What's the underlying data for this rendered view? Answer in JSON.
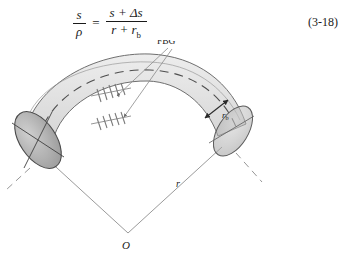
{
  "equation": {
    "name": "bend-strain-relation",
    "left": {
      "numerator": "s",
      "denominator": "ρ"
    },
    "relation": "=",
    "right": {
      "numerator": "s + Δs",
      "denominator_main": "r + r",
      "denominator_sub": "b"
    },
    "number": "(3-18)"
  },
  "figure": {
    "labels": {
      "fbg": "FBG",
      "radius": "r",
      "tube_radius_main": "r",
      "tube_radius_sub": "b",
      "center": "O"
    },
    "colors": {
      "tube_fill": "#e3e3e3",
      "tube_stroke": "#6f6f6f",
      "endcap_fill": "#b4b4b4",
      "endcap_stroke": "#4a4a4a",
      "leader_line": "#8a8a8a",
      "radius_line": "#8a8a8a",
      "dashed_center": "#555555",
      "grating": "#777777",
      "background": "#ffffff",
      "text": "#1a1a1a"
    },
    "grating_sets": [
      {
        "name": "fbg-grating-outer",
        "ticks": 5
      },
      {
        "name": "fbg-grating-inner",
        "ticks": 5
      }
    ]
  }
}
